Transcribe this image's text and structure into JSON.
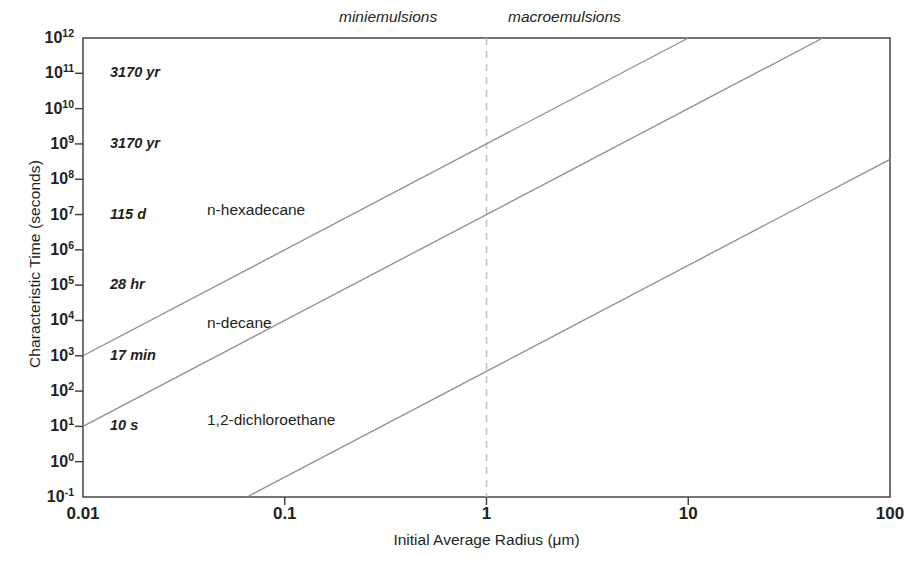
{
  "chart_data": {
    "type": "line",
    "title": "",
    "xlabel": "Initial Average Radius (μm)",
    "ylabel": "Characteristic Time (seconds)",
    "xscale": "log",
    "yscale": "log",
    "xlim": [
      0.01,
      100
    ],
    "ylim": [
      0.1,
      1000000000000
    ],
    "grid": false,
    "legend_position": "inline-labels",
    "xticks": [
      {
        "value": 0.01,
        "label": "0.01"
      },
      {
        "value": 0.1,
        "label": "0.1"
      },
      {
        "value": 1,
        "label": "1"
      },
      {
        "value": 10,
        "label": "10"
      },
      {
        "value": 100,
        "label": "100"
      }
    ],
    "yticks": [
      {
        "exp": 12,
        "mantissa": "10",
        "label": "10¹²"
      },
      {
        "exp": 11,
        "mantissa": "10",
        "label": "10¹¹"
      },
      {
        "exp": 10,
        "mantissa": "10",
        "label": "10¹⁰"
      },
      {
        "exp": 9,
        "mantissa": "10",
        "label": "10⁹"
      },
      {
        "exp": 8,
        "mantissa": "10",
        "label": "10⁸"
      },
      {
        "exp": 7,
        "mantissa": "10",
        "label": "10⁷"
      },
      {
        "exp": 6,
        "mantissa": "10",
        "label": "10⁶"
      },
      {
        "exp": 5,
        "mantissa": "10",
        "label": "10⁵"
      },
      {
        "exp": 4,
        "mantissa": "10",
        "label": "10⁴"
      },
      {
        "exp": 3,
        "mantissa": "10",
        "label": "10³"
      },
      {
        "exp": 2,
        "mantissa": "10",
        "label": "10²"
      },
      {
        "exp": 1,
        "mantissa": "10",
        "label": "10¹"
      },
      {
        "exp": 0,
        "mantissa": "10",
        "label": "10⁰"
      },
      {
        "exp": -1,
        "mantissa": "10",
        "label": "10⁻¹"
      }
    ],
    "series": [
      {
        "name": "n-hexadecane",
        "slope_decades_per_decade": 3,
        "points": [
          [
            0.01,
            1000
          ],
          [
            1,
            1000000000
          ],
          [
            0.0235,
            13000000000000
          ]
        ],
        "x_start": 0.01,
        "y_start": 1000,
        "color": "#8e8e8e"
      },
      {
        "name": "n-decane",
        "slope_decades_per_decade": 3,
        "points": [
          [
            0.01,
            10
          ],
          [
            1,
            10000000
          ],
          [
            100,
            10000000000000
          ]
        ],
        "x_start": 0.01,
        "y_start": 10,
        "color": "#8e8e8e"
      },
      {
        "name": "1,2-dichloroethane",
        "slope_decades_per_decade": 3,
        "points": [
          [
            0.065,
            0.1
          ],
          [
            1,
            360
          ],
          [
            100,
            360000000
          ]
        ],
        "x_start": 0.065,
        "y_start": 0.1,
        "color": "#8e8e8e"
      }
    ],
    "annotations": {
      "time_equivalents": [
        {
          "label": "3170 yr",
          "y_value": 100000000000,
          "x_px": 110
        },
        {
          "label": "3170 yr",
          "y_value": 1000000000,
          "x_px": 110
        },
        {
          "label": "115 d",
          "y_value": 10000000,
          "x_px": 110
        },
        {
          "label": "28 hr",
          "y_value": 100000,
          "x_px": 110
        },
        {
          "label": "17 min",
          "y_value": 1000,
          "x_px": 110
        },
        {
          "label": "10 s",
          "y_value": 10,
          "x_px": 110
        }
      ],
      "curve_labels": [
        {
          "text": "n-hexadecane",
          "x_px": 207,
          "y_px": 201
        },
        {
          "text": "n-decane",
          "x_px": 207,
          "y_px": 314
        },
        {
          "text": "1,2-dichloroethane",
          "x_px": 207,
          "y_px": 411
        }
      ],
      "region_labels": [
        {
          "text": "miniemulsions",
          "x_px": 339,
          "y_px": 8
        },
        {
          "text": "macroemulsions",
          "x_px": 508,
          "y_px": 8
        }
      ],
      "divider": {
        "name": "emulsion-boundary",
        "x_value": 1,
        "style": "dashed",
        "color": "#c2c2c2"
      }
    },
    "colors": {
      "axis": "#3a3a3a",
      "line": "#8e8e8e",
      "text": "#231f20",
      "divider": "#c2c2c2",
      "background": "#ffffff"
    }
  }
}
